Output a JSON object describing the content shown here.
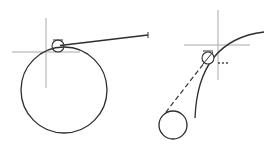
{
  "diagram": {
    "type": "cad-tangent-snap-illustration",
    "colors": {
      "construction_line": "#a8a8a8",
      "geometry": "#2e2e2e",
      "background": "#ffffff"
    },
    "left_figure": {
      "description": "Line drawn tangent to a large circle with tangent snap marker",
      "crosshair": {
        "x": 46,
        "y": 52,
        "h_from": 12,
        "h_to": 80,
        "v_from": 18,
        "v_to": 88
      },
      "circle": {
        "cx": 64,
        "cy": 90,
        "r": 43
      },
      "tangent_marker": {
        "cx": 58,
        "cy": 46,
        "r": 6
      },
      "tangent_line": {
        "x1": 60,
        "y1": 45,
        "x2": 148,
        "y2": 35
      }
    },
    "right_figure": {
      "description": "Deferred tangent snap from arc to small circle (dashed rubber-band line)",
      "crosshair": {
        "x": 218,
        "y": 45,
        "h_from": 184,
        "h_to": 250,
        "v_from": 10,
        "v_to": 80
      },
      "arc": {
        "start": [
          195,
          118
        ],
        "control": [
          205,
          50
        ],
        "end": [
          264,
          32
        ]
      },
      "deferred_tangent_marker": {
        "cx": 208,
        "cy": 58,
        "r": 6,
        "suffix": "..."
      },
      "rubber_band_line": {
        "x1": 208,
        "y1": 58,
        "x2": 166,
        "y2": 112
      },
      "small_circle": {
        "cx": 173,
        "cy": 125,
        "r": 14
      }
    }
  }
}
